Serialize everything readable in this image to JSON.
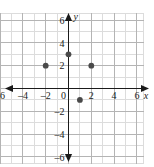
{
  "chart_data": {
    "type": "scatter",
    "title": "",
    "xlabel": "x",
    "ylabel": "y",
    "xlim": [
      -6.6,
      6.6
    ],
    "ylim": [
      -6.6,
      6.6
    ],
    "grid": true,
    "grid_step": 1,
    "major_step": 2,
    "legend": "none",
    "x_tick_labels": [
      "–6",
      "–4",
      "–2",
      "0",
      "2",
      "4",
      "6"
    ],
    "x_tick_values": [
      -6,
      -4,
      -2,
      0,
      2,
      4,
      6
    ],
    "y_tick_labels": [
      "6",
      "4",
      "2",
      "0",
      "–2",
      "–4",
      "–6"
    ],
    "y_tick_values": [
      6,
      4,
      2,
      0,
      -2,
      -4,
      -6
    ],
    "series": [
      {
        "name": "points",
        "marker": "filled-circle",
        "color": "#4a4a4a",
        "points": [
          {
            "x": -2,
            "y": 2
          },
          {
            "x": 0,
            "y": 3
          },
          {
            "x": 2,
            "y": 2
          },
          {
            "x": 1,
            "y": -1
          }
        ]
      }
    ]
  },
  "axes": {
    "x_axis_label": "x",
    "y_axis_label": "y",
    "x_arrow_left": "◀",
    "x_arrow_right": "▶",
    "y_arrow_up": "▲",
    "y_arrow_down": "▼"
  },
  "colors": {
    "grid_minor": "#dcdcdc",
    "grid_major": "#b4b4b4",
    "axis": "#1a1a1a",
    "point": "#4a4a4a",
    "background": "#ffffff"
  }
}
